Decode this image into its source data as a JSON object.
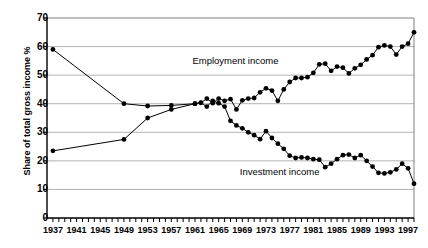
{
  "chart_data": {
    "type": "line",
    "title": "",
    "xlabel": "",
    "ylabel": "Share of total gross income %",
    "ylim": [
      0,
      70
    ],
    "ytick_step": 10,
    "yticks": [
      0,
      10,
      20,
      30,
      40,
      50,
      60,
      70
    ],
    "xlim": [
      1936,
      1998
    ],
    "xticks_labeled": [
      1937,
      1941,
      1945,
      1949,
      1953,
      1957,
      1961,
      1965,
      1969,
      1973,
      1977,
      1981,
      1985,
      1989,
      1993,
      1997
    ],
    "xtick_minor_every": 1,
    "grid": "horizontal",
    "legend": "inline-annotations",
    "annotations": [
      {
        "text": "Employment income",
        "x": 1968,
        "y": 55
      },
      {
        "text": "Investment income",
        "x": 1976,
        "y": 16
      }
    ],
    "marker": "filled-circle",
    "marker_color": "#000000",
    "line_color": "#000000",
    "series": [
      {
        "name": "Employment income",
        "x": [
          1937,
          1949,
          1953,
          1957,
          1961,
          1962,
          1963,
          1964,
          1965,
          1966,
          1967,
          1968,
          1969,
          1970,
          1971,
          1972,
          1973,
          1974,
          1975,
          1976,
          1977,
          1978,
          1979,
          1980,
          1981,
          1982,
          1983,
          1984,
          1985,
          1986,
          1987,
          1988,
          1989,
          1990,
          1991,
          1992,
          1993,
          1994,
          1995,
          1996,
          1997,
          1998
        ],
        "y": [
          59.0,
          40.0,
          39.2,
          39.4,
          40.0,
          40.3,
          41.8,
          40.2,
          41.8,
          41.0,
          41.6,
          38.0,
          41.2,
          41.8,
          42.0,
          44.0,
          45.4,
          44.6,
          41.0,
          45.0,
          47.6,
          49.0,
          49.0,
          49.3,
          50.8,
          53.8,
          54.0,
          51.5,
          53.0,
          52.6,
          50.6,
          52.4,
          53.6,
          55.5,
          57.0,
          59.8,
          60.4,
          60.0,
          57.2,
          60.0,
          61.0,
          65.0
        ]
      },
      {
        "name": "Investment income",
        "x": [
          1937,
          1949,
          1953,
          1957,
          1961,
          1962,
          1963,
          1964,
          1965,
          1966,
          1967,
          1968,
          1969,
          1970,
          1971,
          1972,
          1973,
          1974,
          1975,
          1976,
          1977,
          1978,
          1979,
          1980,
          1981,
          1982,
          1983,
          1984,
          1985,
          1986,
          1987,
          1988,
          1989,
          1990,
          1991,
          1992,
          1993,
          1994,
          1995,
          1996,
          1997,
          1998
        ],
        "y": [
          23.5,
          27.5,
          35.0,
          38.0,
          40.0,
          40.4,
          39.0,
          41.0,
          40.2,
          39.0,
          34.0,
          32.4,
          31.4,
          30.0,
          29.0,
          27.6,
          30.4,
          28.0,
          26.0,
          24.2,
          21.8,
          21.0,
          21.2,
          21.0,
          20.6,
          20.4,
          17.8,
          19.0,
          20.6,
          22.0,
          22.2,
          21.0,
          22.0,
          20.0,
          18.0,
          15.8,
          15.6,
          16.0,
          17.0,
          19.0,
          17.4,
          12.0
        ]
      }
    ]
  }
}
